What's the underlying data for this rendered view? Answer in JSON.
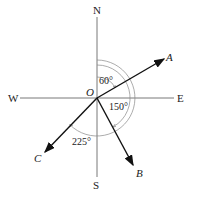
{
  "diagram": {
    "origin": "O",
    "compass": {
      "north": "N",
      "south": "S",
      "east": "E",
      "west": "W"
    },
    "vectors": [
      {
        "label": "A",
        "bearing_deg": 60
      },
      {
        "label": "B",
        "bearing_deg": 150
      },
      {
        "label": "C",
        "bearing_deg": 225
      }
    ],
    "angle_labels": [
      "60°",
      "150°",
      "225°"
    ],
    "colors": {
      "axes": "#555555",
      "vectors": "#111111",
      "arcs": "#888888"
    }
  }
}
